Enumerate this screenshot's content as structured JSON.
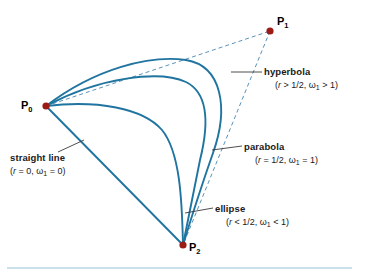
{
  "figure": {
    "colors": {
      "curve": "#1f74a0",
      "control_polygon": "#5b93b8",
      "point": "#9c1b16",
      "text": "#1a1a1a",
      "rule": "#b9d6e6",
      "leader": "#3a3a3a",
      "background": "#ffffff"
    }
  },
  "points": [
    {
      "id": "p0",
      "name": "P",
      "sub": "0",
      "x": 46,
      "y": 106,
      "label_x": 21,
      "label_y": 99
    },
    {
      "id": "p1",
      "name": "P",
      "sub": "1",
      "x": 270,
      "y": 31,
      "label_x": 277,
      "label_y": 15
    },
    {
      "id": "p2",
      "name": "P",
      "sub": "2",
      "x": 183,
      "y": 245,
      "label_x": 189,
      "label_y": 241
    }
  ],
  "annotations": [
    {
      "id": "hyperbola",
      "name": "hyperbola",
      "params": "(r > 1/2, ω",
      "params_sub": "1",
      "params_tail": " > 1)",
      "r_symbol": "r",
      "x": 264,
      "y": 66
    },
    {
      "id": "parabola",
      "name": "parabola",
      "params": "(r = 1/2, ω",
      "params_sub": "1",
      "params_tail": " = 1)",
      "r_symbol": "r",
      "x": 244,
      "y": 141
    },
    {
      "id": "ellipse",
      "name": "ellipse",
      "params": "(r < 1/2, ω",
      "params_sub": "1",
      "params_tail": " < 1)",
      "r_symbol": "r",
      "x": 215,
      "y": 203
    },
    {
      "id": "straight-line",
      "name": "straight line",
      "params": "(r = 0, ω",
      "params_sub": "1",
      "params_tail": " = 0)",
      "r_symbol": "r",
      "x": 10,
      "y": 152
    }
  ],
  "curves": {
    "hyperbola_path": "M 46,106 C 96,68 150,55 186,60 C 222,66 229,108 213,153 C 200,190 190,222 183,245",
    "parabola_path": "M 46,106 C 100,77 160,70 186,82 C 210,94 208,128 200,160 C 193,194 187,224 183,245",
    "ellipse_path": "M 46,106 C 97,100 143,108 162,130 C 180,152 182,200 183,245",
    "straight_path": "M 46,106 L 183,245",
    "dash_p0_p1": "M 46,106 L 270,31",
    "dash_p1_p2": "M 270,31 L 183,245"
  },
  "leaders": [
    {
      "id": "leader-hyperbola",
      "x1": 231,
      "y1": 72,
      "x2": 262,
      "y2": 72
    },
    {
      "id": "leader-parabola",
      "x1": 212,
      "y1": 150,
      "x2": 242,
      "y2": 146
    },
    {
      "id": "leader-ellipse",
      "x1": 185,
      "y1": 213,
      "x2": 213,
      "y2": 208
    },
    {
      "id": "leader-straight-line",
      "x1": 58,
      "y1": 152,
      "x2": 84,
      "y2": 140
    }
  ],
  "bottom_rule": {
    "x1": 7,
    "y1": 268,
    "x2": 352,
    "y2": 268
  }
}
